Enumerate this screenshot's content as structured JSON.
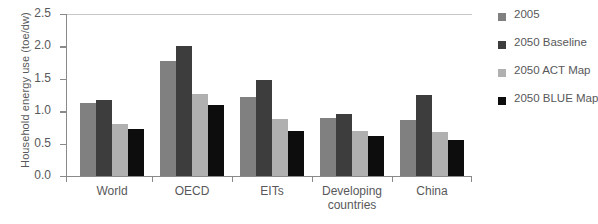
{
  "chart_data": {
    "type": "bar",
    "title": "",
    "xlabel": "",
    "ylabel": "Household energy use (toe/dw)",
    "ylim": [
      0,
      2.5
    ],
    "ytick_labels": [
      "0.0",
      "0.5",
      "1.0",
      "1.5",
      "2.0",
      "2.5"
    ],
    "ytick_values": [
      0.0,
      0.5,
      1.0,
      1.5,
      2.0,
      2.5
    ],
    "grid": "top-gridline-only",
    "legend_position": "right",
    "categories": [
      "World",
      "OECD",
      "EITs",
      "Developing\ncountries",
      "China"
    ],
    "series": [
      {
        "name": "2005",
        "color": "#808080",
        "values": [
          1.12,
          1.78,
          1.22,
          0.89,
          0.87
        ]
      },
      {
        "name": "2050 Baseline",
        "color": "#3d3d3d",
        "values": [
          1.17,
          2.0,
          1.48,
          0.95,
          1.25
        ]
      },
      {
        "name": "2050 ACT Map",
        "color": "#b0b0b0",
        "values": [
          0.81,
          1.26,
          0.88,
          0.69,
          0.68
        ]
      },
      {
        "name": "2050 BLUE Map",
        "color": "#0d0d0d",
        "values": [
          0.72,
          1.1,
          0.7,
          0.62,
          0.55
        ]
      }
    ]
  },
  "colors": {
    "axis": "#8a8a8c",
    "gridline": "#c8c8ca",
    "text": "#58585a",
    "background": "#ffffff"
  }
}
